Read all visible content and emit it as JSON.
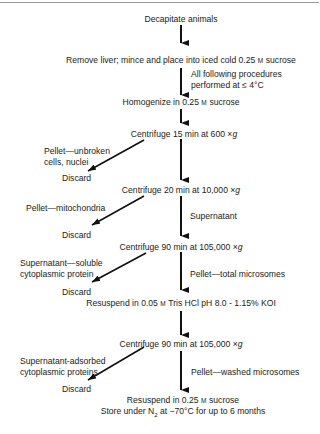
{
  "diagram": {
    "steps": [
      {
        "text": "Decapitate animals"
      },
      {
        "pre": "Remove liver; mince and place into iced cold 0.25 ",
        "unit": "M",
        "post": " sucrose"
      },
      {
        "pre": "Homogenize in 0.25 ",
        "unit": "M",
        "post": " sucrose"
      },
      {
        "pre": "Centrifuge 15 min at 600 ",
        "x": "×",
        "g": "g"
      },
      {
        "pre": "Centrifuge 20 min at 10,000 ",
        "x": "×",
        "g": "g"
      },
      {
        "pre": "Centrifuge 90 min at 105,000 ",
        "x": "×",
        "g": "g"
      },
      {
        "pre": "Resuspend in 0.05 ",
        "unit": "M",
        "post": " Tris HCl pH 8.0 - 1.15% KOI"
      },
      {
        "pre": "Centrifuge 90 min at 105,000 ",
        "x": "×",
        "g": "g"
      },
      {
        "pre": "Resuspend in 0.25 ",
        "unit": "M",
        "post": " sucrose"
      },
      {
        "pre": "Store under N",
        "sub": "2",
        "post": " at −70°C for up to 6 months"
      }
    ],
    "side_notes": {
      "temp_note_1": "All following procedures",
      "temp_note_2": "performed at ≤ 4°C",
      "supernatant": "Supernatant",
      "pellet_total": "Pellet—total microsomes",
      "pellet_washed": "Pellet—washed microsomes"
    },
    "discards": [
      {
        "label_1": "Pellet—unbroken",
        "label_2": "cells, nuclei",
        "discard": "Discard"
      },
      {
        "label_1": "Pellet—mitochondria",
        "discard": "Discard"
      },
      {
        "label_1": "Supernatant—soluble",
        "label_2": "cytoplasmic protein",
        "discard": "Discard"
      },
      {
        "label_1": "Supernatant-adsorbed",
        "label_2": "cytoplasmic proteins",
        "discard": "Discard"
      }
    ]
  }
}
